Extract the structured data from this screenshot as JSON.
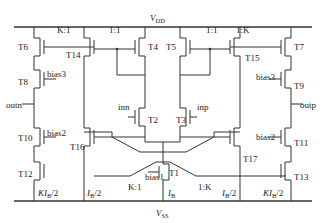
{
  "diagram": {
    "type": "circuit-schematic",
    "rails": {
      "top": "V",
      "top_sub": "DD",
      "bottom": "V",
      "bottom_sub": "SS"
    },
    "transistors": {
      "T1": "T1",
      "T2": "T2",
      "T3": "T3",
      "T4": "T4",
      "T5": "T5",
      "T6": "T6",
      "T7": "T7",
      "T8": "T8",
      "T9": "T9",
      "T10": "T10",
      "T11": "T11",
      "T12": "T12",
      "T13": "T13",
      "T14": "T14",
      "T15": "T15",
      "T16": "T16",
      "T17": "T17"
    },
    "ratios": {
      "left_top": "K:1",
      "mid_left_top": "1:1",
      "mid_right_top": "1:1",
      "right_top": "1:K",
      "left_bottom": "K:1",
      "right_bottom": "1:K"
    },
    "signals": {
      "bias1": "bias1",
      "bias2_left": "bias2",
      "bias2_right": "bias2",
      "bias3_left": "bias3",
      "bias3_right": "bias3",
      "inn": "inn",
      "inp": "inp",
      "outn": "outn",
      "outp": "outp"
    },
    "currents": {
      "left_outer": "KI",
      "left_outer_tail": "/2",
      "left_inner": "I",
      "left_inner_tail": "/2",
      "center": "I",
      "right_inner": "I",
      "right_inner_tail": "/2",
      "right_outer": "KI",
      "right_outer_tail": "/2",
      "sub": "B"
    }
  }
}
